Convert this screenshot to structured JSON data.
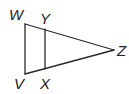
{
  "diagram": {
    "type": "geometry",
    "points": {
      "W": {
        "x": 25,
        "y": 24,
        "label": "W"
      },
      "V": {
        "x": 25,
        "y": 74,
        "label": "V"
      },
      "Y": {
        "x": 45,
        "y": 29,
        "label": "Y"
      },
      "X": {
        "x": 45,
        "y": 69,
        "label": "X"
      },
      "Z": {
        "x": 114,
        "y": 50,
        "label": "Z"
      }
    },
    "segments": [
      [
        "W",
        "V"
      ],
      [
        "W",
        "Z"
      ],
      [
        "V",
        "Z"
      ],
      [
        "Y",
        "X"
      ]
    ],
    "colors": {
      "stroke": "#2a2a2a",
      "text": "#222222",
      "background": "#ffffff"
    }
  }
}
